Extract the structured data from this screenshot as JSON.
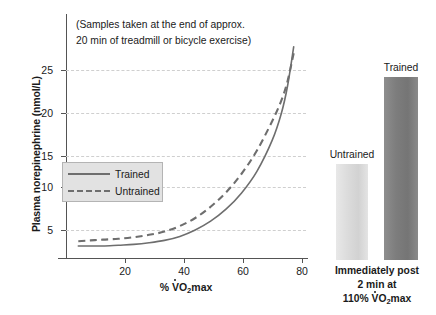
{
  "chart_data": {
    "type": "line",
    "title": "",
    "annotation": [
      "(Samples taken at the end of approx.",
      "20 min of treadmill or bicycle exercise)"
    ],
    "xlabel": "% VO2max",
    "ylabel": "Plasma norepinephrine (nmol/L)",
    "xlim": [
      8,
      86
    ],
    "ylim": [
      0,
      29
    ],
    "xticks": [
      20,
      40,
      60,
      80
    ],
    "yticks": [
      5,
      10,
      15,
      20,
      25
    ],
    "grid": true,
    "legend_position": "center-left",
    "series": [
      {
        "name": "Trained",
        "style": "solid",
        "color": "#6e6e6e",
        "x": [
          12,
          16,
          20,
          25,
          30,
          35,
          40,
          45,
          50,
          55,
          60,
          65,
          70,
          75,
          78,
          80,
          82
        ],
        "y": [
          3.0,
          3.0,
          3.0,
          3.1,
          3.2,
          3.4,
          3.7,
          4.2,
          5.0,
          6.1,
          7.6,
          9.6,
          12.3,
          16.2,
          19.6,
          23.0,
          27.9
        ]
      },
      {
        "name": "Untrained",
        "style": "dashed",
        "color": "#6e6e6e",
        "x": [
          12,
          16,
          20,
          25,
          30,
          35,
          40,
          45,
          50,
          55,
          60,
          65,
          70,
          75,
          78,
          80,
          82
        ],
        "y": [
          3.6,
          3.7,
          3.8,
          3.9,
          4.1,
          4.4,
          4.8,
          5.5,
          6.5,
          7.9,
          9.7,
          12.0,
          14.9,
          18.6,
          21.2,
          23.6,
          27.1
        ]
      }
    ],
    "bar_panel": {
      "type": "bar",
      "caption": [
        "Immediately post",
        "2 min at",
        "110% VO2max"
      ],
      "categories": [
        "Untrained",
        "Trained"
      ],
      "values": [
        41,
        78
      ],
      "colors": [
        "#dcdcdc",
        "#7d7d7d"
      ]
    }
  },
  "axis": {
    "y_title": "Plasma norepinephrine (nmol/L)",
    "y_ticks": [
      "25",
      "20",
      "15",
      "10",
      "5"
    ],
    "x_ticks": [
      "20",
      "40",
      "60",
      "80"
    ],
    "x_title_prefix": "% ",
    "x_title_v": "V",
    "x_title_o": "O",
    "x_title_sub": "2",
    "x_title_suffix": "max"
  },
  "annotation": {
    "line1": "(Samples taken at the end of approx.",
    "line2": "20 min of treadmill or bicycle exercise)"
  },
  "legend": {
    "trained": "Trained",
    "untrained": "Untrained"
  },
  "bars": {
    "untrained_label": "Untrained",
    "trained_label": "Trained",
    "footer_line1": "Immediately post",
    "footer_line2": "2 min at",
    "footer_line3_prefix": "110% ",
    "footer_v": "V",
    "footer_o": "O",
    "footer_sub": "2",
    "footer_suffix": "max"
  }
}
